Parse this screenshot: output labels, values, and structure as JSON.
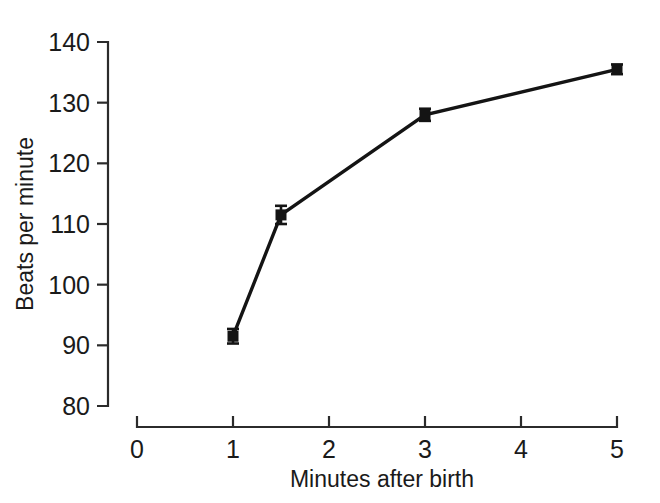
{
  "chart_data": {
    "type": "line",
    "title": "",
    "xlabel": "Minutes after birth",
    "ylabel": "Beats per minute",
    "xlim": [
      0,
      5
    ],
    "ylim": [
      80,
      140
    ],
    "xticks": [
      0,
      1,
      2,
      3,
      4,
      5
    ],
    "xtick_labels": [
      "0",
      "1",
      "2",
      "3",
      "4",
      "5"
    ],
    "yticks": [
      80,
      90,
      100,
      110,
      120,
      130,
      140
    ],
    "ytick_labels": [
      "80",
      "90",
      "100",
      "110",
      "120",
      "130",
      "140"
    ],
    "grid": false,
    "legend": "none",
    "marker": "square",
    "line_color": "#141414",
    "marker_color": "#141414",
    "background": "#ffffff",
    "x": [
      1,
      1.5,
      3,
      5
    ],
    "values": [
      91.5,
      111.5,
      128.0,
      135.5
    ],
    "error_bars": [
      1.2,
      1.5,
      1.0,
      0.8
    ],
    "series": [
      {
        "name": "Heart rate",
        "x": [
          1,
          1.5,
          3,
          5
        ],
        "values": [
          91.5,
          111.5,
          128.0,
          135.5
        ],
        "error_bars": [
          1.2,
          1.5,
          1.0,
          0.8
        ]
      }
    ],
    "points": [
      {
        "x": 1,
        "y": 91.5,
        "err": 1.2
      },
      {
        "x": 1.5,
        "y": 111.5,
        "err": 1.5
      },
      {
        "x": 3,
        "y": 128.0,
        "err": 1.0
      },
      {
        "x": 5,
        "y": 135.5,
        "err": 0.8
      }
    ]
  }
}
